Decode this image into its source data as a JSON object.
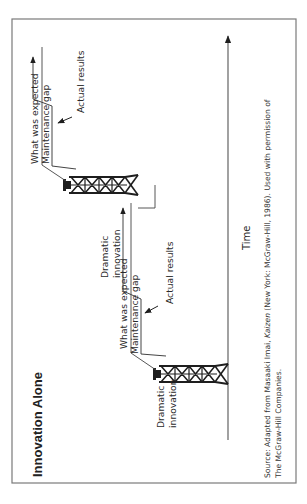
{
  "figure": {
    "title": "Innovation Alone",
    "axis_label": "Time",
    "steps": [
      {
        "label_innovation": [
          "Dramatic",
          "innovation"
        ],
        "label_expected": "What was expected",
        "label_gap": "Maintenance gap",
        "label_actual": "Actual results"
      },
      {
        "label_innovation": [
          "Dramatic",
          "innovation"
        ],
        "label_expected": "What was expected",
        "label_gap": "Maintenance gap",
        "label_actual": "Actual results"
      }
    ],
    "source": {
      "line1_prefix": "Source: Adapted from Masaaki Imai, ",
      "line1_italic": "Kaizen",
      "line1_suffix": " (New York: McGraw-Hill, 1986). Used with permission of",
      "line2": "The McGraw-Hill Companies."
    },
    "colors": {
      "line": "#3a3a3a",
      "frame": "#7a7a7a",
      "pylon": "#1e1e1e"
    },
    "orientation": "rotated-90-ccw"
  }
}
